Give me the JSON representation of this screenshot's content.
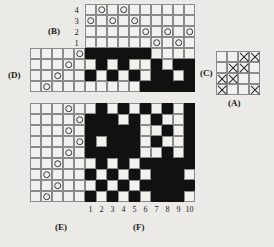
{
  "figure": {
    "cell_size": 11,
    "symbols": {
      "filled": "black-square",
      "circle": "open-circle",
      "cross": "x-mark"
    },
    "labels": {
      "A": "(A)",
      "B": "(B)",
      "C": "(C)",
      "D": "(D)",
      "E": "(E)",
      "F": "(F)"
    }
  },
  "threading": {
    "name": "threading-draft",
    "label": "(B)",
    "shaft_labels": [
      "4",
      "3",
      "2",
      "1"
    ],
    "columns": 10,
    "rows": 4,
    "marks": [
      {
        "shaft": 4,
        "column": 2
      },
      {
        "shaft": 4,
        "column": 4
      },
      {
        "shaft": 3,
        "column": 1
      },
      {
        "shaft": 3,
        "column": 3
      },
      {
        "shaft": 3,
        "column": 5
      },
      {
        "shaft": 2,
        "column": 6
      },
      {
        "shaft": 2,
        "column": 8
      },
      {
        "shaft": 2,
        "column": 10
      },
      {
        "shaft": 1,
        "column": 7
      },
      {
        "shaft": 1,
        "column": 9
      }
    ]
  },
  "tieup": {
    "name": "tie-up",
    "label_left": "(C)",
    "label_below": "(A)",
    "rows": 4,
    "columns": 4,
    "marks": [
      {
        "row": 1,
        "col": 3
      },
      {
        "row": 1,
        "col": 4
      },
      {
        "row": 2,
        "col": 2
      },
      {
        "row": 2,
        "col": 3
      },
      {
        "row": 3,
        "col": 1
      },
      {
        "row": 3,
        "col": 2
      },
      {
        "row": 4,
        "col": 1
      },
      {
        "row": 4,
        "col": 4
      }
    ]
  },
  "treadling_upper": {
    "name": "treadling-upper",
    "label": "(D)",
    "columns": 5,
    "rows": 4,
    "marks": [
      {
        "row": 1,
        "col": 5
      },
      {
        "row": 2,
        "col": 4
      },
      {
        "row": 3,
        "col": 3
      },
      {
        "row": 4,
        "col": 2
      }
    ]
  },
  "treadling_lower": {
    "name": "treadling-lower",
    "label": "(E)",
    "columns": 5,
    "rows": 9,
    "marks": [
      {
        "row": 1,
        "col": 4
      },
      {
        "row": 2,
        "col": 5
      },
      {
        "row": 3,
        "col": 4
      },
      {
        "row": 4,
        "col": 5
      },
      {
        "row": 5,
        "col": 4
      },
      {
        "row": 6,
        "col": 3
      },
      {
        "row": 7,
        "col": 2
      },
      {
        "row": 8,
        "col": 3
      },
      {
        "row": 9,
        "col": 2
      }
    ]
  },
  "drawdown_upper": {
    "name": "drawdown-upper",
    "columns": 10,
    "rows": 4,
    "grid": [
      [
        1,
        1,
        1,
        1,
        1,
        1,
        0,
        0,
        0,
        0
      ],
      [
        0,
        1,
        0,
        1,
        0,
        0,
        1,
        0,
        1,
        1
      ],
      [
        1,
        0,
        1,
        0,
        1,
        0,
        1,
        1,
        0,
        1
      ],
      [
        0,
        0,
        0,
        0,
        0,
        1,
        1,
        1,
        1,
        1
      ]
    ]
  },
  "drawdown_lower": {
    "name": "drawdown-lower",
    "label": "(F)",
    "columns": 10,
    "rows": 9,
    "column_labels": [
      "1",
      "2",
      "3",
      "4",
      "5",
      "6",
      "7",
      "8",
      "9",
      "10"
    ],
    "grid": [
      [
        0,
        1,
        0,
        1,
        0,
        1,
        0,
        1,
        0,
        1
      ],
      [
        1,
        1,
        1,
        0,
        1,
        0,
        1,
        0,
        0,
        1
      ],
      [
        1,
        1,
        1,
        1,
        1,
        0,
        0,
        1,
        0,
        1
      ],
      [
        1,
        0,
        1,
        1,
        1,
        0,
        1,
        0,
        0,
        1
      ],
      [
        1,
        1,
        1,
        1,
        1,
        0,
        0,
        1,
        0,
        1
      ],
      [
        0,
        1,
        0,
        1,
        0,
        1,
        1,
        1,
        1,
        1
      ],
      [
        1,
        0,
        1,
        0,
        1,
        0,
        1,
        1,
        1,
        0
      ],
      [
        0,
        1,
        0,
        1,
        0,
        1,
        1,
        1,
        1,
        1
      ],
      [
        1,
        0,
        1,
        0,
        1,
        0,
        1,
        1,
        1,
        0
      ]
    ]
  }
}
